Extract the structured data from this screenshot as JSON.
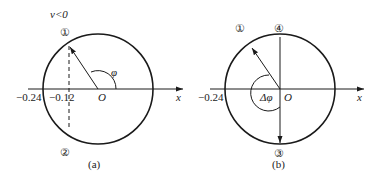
{
  "figure_a": {
    "caption": "(a)",
    "condition": "v<0",
    "state_top": "①",
    "state_bottom": "②",
    "tick_outer": "−0.24",
    "tick_inner": "−0.12",
    "origin": "O",
    "axis": "x",
    "angle": "φ"
  },
  "figure_b": {
    "caption": "(b)",
    "state_1": "①",
    "state_4": "④",
    "state_3": "③",
    "tick_outer": "−0.24",
    "origin": "O",
    "axis": "x",
    "angle": "Δφ"
  },
  "colors": {
    "stroke": "#1a1a1a",
    "text": "#222222"
  }
}
